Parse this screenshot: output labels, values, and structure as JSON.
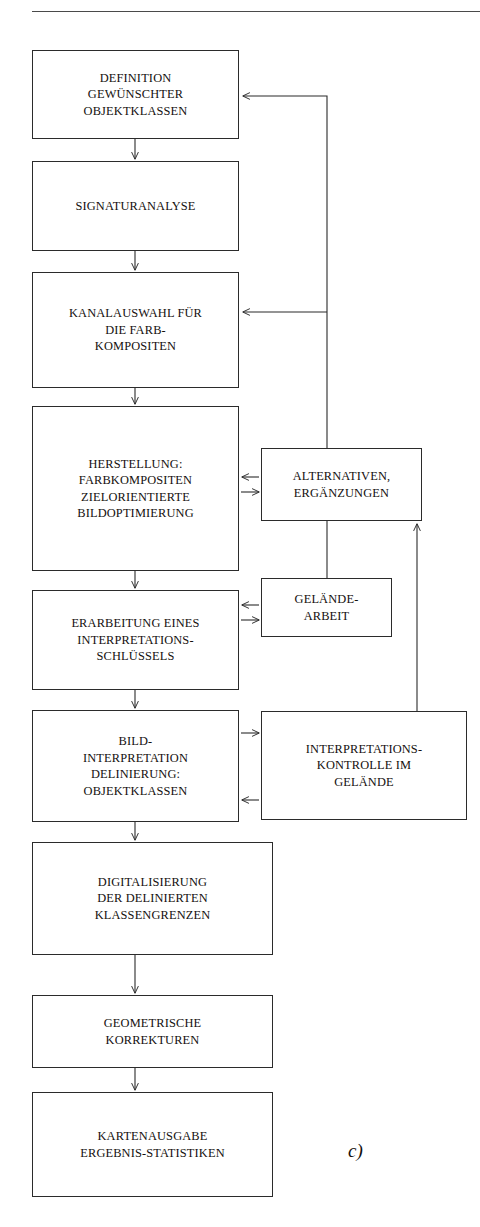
{
  "figure": {
    "label": "c)",
    "top_rule": true,
    "stroke_color": "#2b2b2b",
    "rule_color": "#4a4a4a"
  },
  "diagram_data": {
    "type": "flowchart",
    "title": "",
    "orientation": "vertical-with-right-feedback-column",
    "nodes": [
      {
        "id": "definition",
        "text": "DEFINITION\nGEWÜNSCHTER\nOBJEKTKLASSEN",
        "column": "main",
        "x": 32,
        "y": 50,
        "w": 207,
        "h": 89
      },
      {
        "id": "signaturanalyse",
        "text": "SIGNATURANALYSE",
        "column": "main",
        "x": 32,
        "y": 161,
        "w": 207,
        "h": 90
      },
      {
        "id": "kanalauswahl",
        "text": "KANALAUSWAHL FÜR\nDIE FARB-\nKOMPOSITEN",
        "column": "main",
        "x": 32,
        "y": 272,
        "w": 207,
        "h": 116
      },
      {
        "id": "herstellung",
        "text": "HERSTELLUNG:\nFARBKOMPOSITEN\nZIELORIENTIERTE\nBILDOPTIMIERUNG",
        "column": "main",
        "x": 32,
        "y": 406,
        "w": 207,
        "h": 165
      },
      {
        "id": "erarbeitung",
        "text": "ERARBEITUNG EINES\nINTERPRETATIONS-\nSCHLÜSSELS",
        "column": "main",
        "x": 32,
        "y": 590,
        "w": 207,
        "h": 100
      },
      {
        "id": "bildinterpretation",
        "text": "BILD-\nINTERPRETATION\nDELINIERUNG:\nOBJEKTKLASSEN",
        "column": "main",
        "x": 32,
        "y": 710,
        "w": 207,
        "h": 112
      },
      {
        "id": "digitalisierung",
        "text": "DIGITALISIERUNG\nDER DELINIERTEN\nKLASSENGRENZEN",
        "column": "main",
        "x": 32,
        "y": 842,
        "w": 241,
        "h": 113
      },
      {
        "id": "geometrische",
        "text": "GEOMETRISCHE\nKORREKTUREN",
        "column": "main",
        "x": 32,
        "y": 995,
        "w": 241,
        "h": 73
      },
      {
        "id": "kartenausgabe",
        "text": "KARTENAUSGABE\nERGEBNIS-STATISTIKEN",
        "column": "main",
        "x": 32,
        "y": 1092,
        "w": 241,
        "h": 105
      },
      {
        "id": "alternativen",
        "text": "ALTERNATIVEN,\nERGÄNZUNGEN",
        "column": "feedback",
        "x": 261,
        "y": 448,
        "w": 161,
        "h": 73
      },
      {
        "id": "gelaendearbeit",
        "text": "GELÄNDE-\nARBEIT",
        "column": "feedback",
        "x": 261,
        "y": 578,
        "w": 131,
        "h": 59
      },
      {
        "id": "interpretationskontrolle",
        "text": "INTERPRETATIONS-\nKONTROLLE IM\nGELÄNDE",
        "column": "feedback",
        "x": 261,
        "y": 711,
        "w": 206,
        "h": 109
      }
    ],
    "edges": [
      {
        "from": "definition",
        "to": "signaturanalyse",
        "kind": "down-arrow"
      },
      {
        "from": "signaturanalyse",
        "to": "kanalauswahl",
        "kind": "down-arrow"
      },
      {
        "from": "kanalauswahl",
        "to": "herstellung",
        "kind": "down-arrow"
      },
      {
        "from": "herstellung",
        "to": "erarbeitung",
        "kind": "down-arrow"
      },
      {
        "from": "erarbeitung",
        "to": "bildinterpretation",
        "kind": "down-arrow"
      },
      {
        "from": "bildinterpretation",
        "to": "digitalisierung",
        "kind": "down-arrow"
      },
      {
        "from": "digitalisierung",
        "to": "geometrische",
        "kind": "down-arrow"
      },
      {
        "from": "geometrische",
        "to": "kartenausgabe",
        "kind": "down-arrow"
      },
      {
        "from": "alternativen",
        "to": "definition",
        "kind": "feedback-up-left-arrow"
      },
      {
        "from": "alternativen",
        "to": "kanalauswahl",
        "kind": "feedback-left-arrow"
      },
      {
        "from": "alternativen",
        "to": "herstellung",
        "kind": "left-arrow"
      },
      {
        "from": "herstellung",
        "to": "alternativen",
        "kind": "right-arrow"
      },
      {
        "from": "gelaendearbeit",
        "to": "erarbeitung",
        "kind": "left-arrow"
      },
      {
        "from": "erarbeitung",
        "to": "gelaendearbeit",
        "kind": "right-arrow"
      },
      {
        "from": "gelaendearbeit",
        "to": "alternativen",
        "kind": "up-line"
      },
      {
        "from": "bildinterpretation",
        "to": "interpretationskontrolle",
        "kind": "right-arrow"
      },
      {
        "from": "interpretationskontrolle",
        "to": "bildinterpretation",
        "kind": "left-arrow"
      },
      {
        "from": "interpretationskontrolle",
        "to": "alternativen",
        "kind": "feedback-up-arrow"
      }
    ]
  }
}
